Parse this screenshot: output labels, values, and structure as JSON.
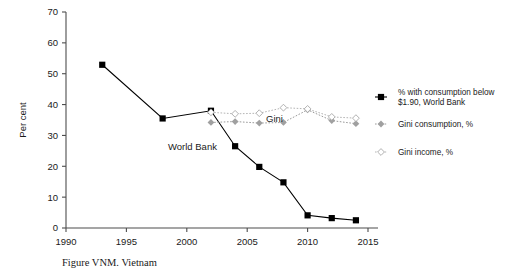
{
  "figure": {
    "caption": "Figure VNM. Vietnam",
    "ylabel": "Per cent"
  },
  "annotations": {
    "gini": "Gini",
    "world_bank": "World Bank"
  },
  "legend": {
    "items": [
      {
        "label_line1": "% with consumption below",
        "label_line2": "$1.90, World Bank",
        "marker": "filled-square-solid-line",
        "color": "#000000"
      },
      {
        "label_line1": "Gini consumption, %",
        "label_line2": "",
        "marker": "filled-diamond-dotted-line",
        "color": "#a0a0a0"
      },
      {
        "label_line1": "Gini income, %",
        "label_line2": "",
        "marker": "open-diamond-dotted-line",
        "color": "#b5b5b5"
      }
    ]
  },
  "chart_data": {
    "type": "line",
    "title": "Figure VNM. Vietnam",
    "xlabel": "",
    "ylabel": "Per cent",
    "xlim": [
      1990,
      2015
    ],
    "ylim": [
      0,
      70
    ],
    "xticks": [
      1990,
      1995,
      2000,
      2005,
      2010,
      2015
    ],
    "yticks": [
      0,
      10,
      20,
      30,
      40,
      50,
      60,
      70
    ],
    "grid": false,
    "legend_position": "right",
    "series": [
      {
        "name": "% with consumption below $1.90, World Bank",
        "marker": "filled-square",
        "linestyle": "solid",
        "color": "#000000",
        "x": [
          1993,
          1998,
          2002,
          2004,
          2006,
          2008,
          2010,
          2012,
          2014
        ],
        "values": [
          52.9,
          35.5,
          38.0,
          26.5,
          19.8,
          14.8,
          4.1,
          3.2,
          2.5
        ]
      },
      {
        "name": "Gini consumption, %",
        "marker": "filled-diamond",
        "linestyle": "dotted",
        "color": "#a0a0a0",
        "x": [
          2002,
          2004,
          2006,
          2008,
          2010,
          2012,
          2014
        ],
        "values": [
          34.2,
          34.5,
          34.0,
          34.2,
          38.3,
          34.8,
          33.8
        ]
      },
      {
        "name": "Gini income, %",
        "marker": "open-diamond",
        "linestyle": "dotted",
        "color": "#b5b5b5",
        "x": [
          2002,
          2004,
          2006,
          2008,
          2010,
          2012,
          2014
        ],
        "values": [
          37.5,
          37.0,
          37.2,
          39.0,
          38.6,
          36.0,
          35.6
        ]
      }
    ]
  }
}
